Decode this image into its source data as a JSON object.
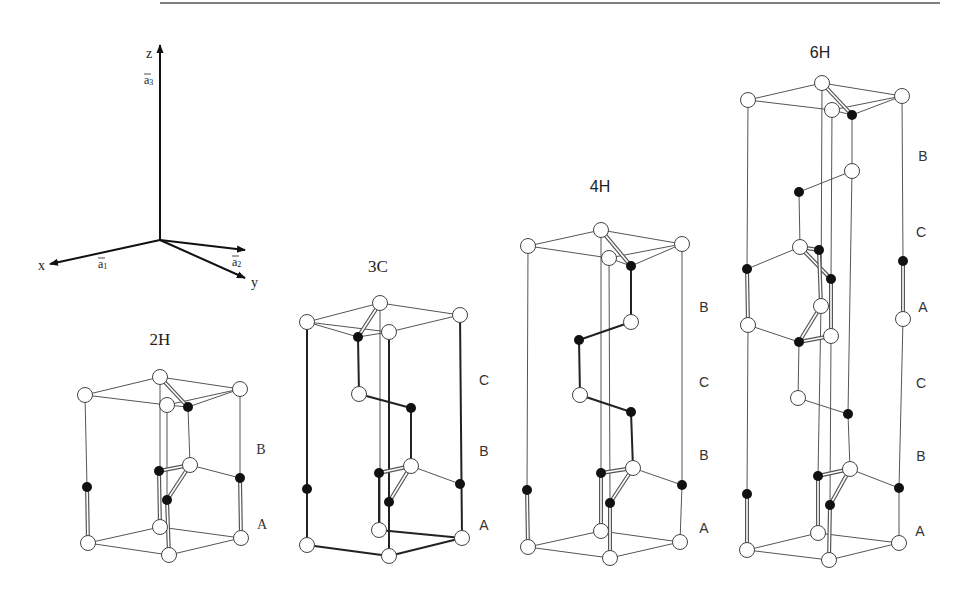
{
  "figure": {
    "top_rule": {
      "x1": 160,
      "x2": 940,
      "y": 3,
      "color": "#555555"
    },
    "axes": {
      "origin": [
        160,
        240
      ],
      "z": {
        "tip": [
          160,
          45
        ],
        "label": "z",
        "label_pos": [
          146,
          58
        ]
      },
      "a3": {
        "label": "a3",
        "label_pos": [
          144,
          84
        ]
      },
      "x": {
        "tip": [
          50,
          264
        ],
        "label": "x",
        "label_pos": [
          38,
          270
        ]
      },
      "a1": {
        "label": "a1",
        "label_pos": [
          98,
          268
        ]
      },
      "a2": {
        "tip": [
          245,
          250
        ],
        "label": "a2",
        "label_pos": [
          232,
          266
        ]
      },
      "y": {
        "tip": [
          245,
          278
        ],
        "label": "y",
        "label_pos": [
          251,
          287
        ]
      }
    },
    "polytypes": [
      {
        "name": "2H",
        "title_pos": [
          160,
          345
        ],
        "title_font": "serif",
        "stacking": [
          {
            "label": "B",
            "pos": [
              261,
              454
            ]
          },
          {
            "label": "A",
            "pos": [
              262,
              529
            ]
          }
        ],
        "open_atoms": [
          [
            85,
            395
          ],
          [
            160,
            377
          ],
          [
            240,
            389
          ],
          [
            167,
            405
          ],
          [
            190,
            465
          ],
          [
            160,
            527
          ],
          [
            88,
            543
          ],
          [
            241,
            538
          ],
          [
            169,
            555
          ]
        ],
        "filled_atoms": [
          [
            188,
            407
          ],
          [
            159,
            471
          ],
          [
            87,
            487
          ],
          [
            240,
            478
          ],
          [
            167,
            500
          ]
        ],
        "lines": [
          [
            85,
            395,
            160,
            377
          ],
          [
            160,
            377,
            240,
            389
          ],
          [
            85,
            395,
            167,
            405
          ],
          [
            167,
            405,
            240,
            389
          ],
          [
            188,
            407,
            240,
            389
          ],
          [
            167,
            405,
            188,
            407
          ],
          [
            85,
            395,
            87,
            487
          ],
          [
            160,
            377,
            160,
            527
          ],
          [
            240,
            389,
            240,
            478
          ],
          [
            167,
            405,
            167,
            500
          ],
          [
            188,
            407,
            190,
            465
          ],
          [
            190,
            465,
            240,
            478
          ],
          [
            88,
            543,
            160,
            527
          ],
          [
            160,
            527,
            241,
            538
          ],
          [
            88,
            543,
            169,
            555
          ],
          [
            169,
            555,
            241,
            538
          ]
        ],
        "double_lines": [
          [
            160,
            377,
            188,
            407
          ],
          [
            159,
            471,
            190,
            465
          ],
          [
            190,
            465,
            167,
            500
          ],
          [
            87,
            487,
            88,
            543
          ],
          [
            240,
            478,
            241,
            538
          ],
          [
            167,
            500,
            169,
            555
          ],
          [
            159,
            471,
            160,
            527
          ]
        ]
      },
      {
        "name": "3C",
        "title_pos": [
          378,
          272
        ],
        "title_font": "serif",
        "stacking": [
          {
            "label": "C",
            "pos": [
              484,
              385
            ]
          },
          {
            "label": "B",
            "pos": [
              484,
              456
            ]
          },
          {
            "label": "A",
            "pos": [
              484,
              530
            ]
          }
        ],
        "open_atoms": [
          [
            307,
            322
          ],
          [
            380,
            303
          ],
          [
            460,
            315
          ],
          [
            389,
            332
          ],
          [
            359,
            394
          ],
          [
            411,
            466
          ],
          [
            379,
            530
          ],
          [
            307,
            545
          ],
          [
            462,
            538
          ],
          [
            389,
            556
          ]
        ],
        "filled_atoms": [
          [
            358,
            337
          ],
          [
            411,
            408
          ],
          [
            379,
            473
          ],
          [
            307,
            489
          ],
          [
            460,
            484
          ],
          [
            389,
            502
          ]
        ],
        "lines": [
          [
            307,
            322,
            380,
            303
          ],
          [
            380,
            303,
            460,
            315
          ],
          [
            307,
            322,
            389,
            332
          ],
          [
            389,
            332,
            460,
            315
          ],
          [
            307,
            322,
            358,
            337
          ],
          [
            358,
            337,
            389,
            332
          ],
          [
            380,
            303,
            380,
            530
          ],
          [
            411,
            466,
            460,
            484
          ]
        ],
        "thick_lines": [
          [
            307,
            322,
            307,
            545
          ],
          [
            460,
            315,
            462,
            538
          ],
          [
            389,
            332,
            389,
            556
          ],
          [
            358,
            337,
            359,
            394
          ],
          [
            359,
            394,
            411,
            408
          ],
          [
            411,
            408,
            411,
            466
          ],
          [
            379,
            473,
            379,
            530
          ],
          [
            307,
            545,
            389,
            556
          ],
          [
            389,
            556,
            462,
            538
          ],
          [
            379,
            530,
            462,
            538
          ]
        ],
        "double_lines": [
          [
            380,
            303,
            358,
            337
          ],
          [
            379,
            473,
            411,
            466
          ],
          [
            411,
            466,
            389,
            502
          ]
        ]
      },
      {
        "name": "4H",
        "title_pos": [
          600,
          192
        ],
        "title_font": "sans",
        "stacking": [
          {
            "label": "B",
            "pos": [
              704,
              312
            ]
          },
          {
            "label": "C",
            "pos": [
              704,
              387
            ]
          },
          {
            "label": "B",
            "pos": [
              704,
              460
            ]
          },
          {
            "label": "A",
            "pos": [
              704,
              533
            ]
          }
        ],
        "open_atoms": [
          [
            528,
            246
          ],
          [
            601,
            230
          ],
          [
            682,
            244
          ],
          [
            609,
            258
          ],
          [
            631,
            322
          ],
          [
            580,
            395
          ],
          [
            633,
            468
          ],
          [
            601,
            531
          ],
          [
            528,
            547
          ],
          [
            680,
            542
          ],
          [
            610,
            558
          ]
        ],
        "filled_atoms": [
          [
            631,
            266
          ],
          [
            579,
            340
          ],
          [
            631,
            412
          ],
          [
            601,
            473
          ],
          [
            527,
            490
          ],
          [
            682,
            485
          ],
          [
            610,
            503
          ]
        ],
        "lines": [
          [
            528,
            246,
            601,
            230
          ],
          [
            601,
            230,
            682,
            244
          ],
          [
            528,
            246,
            609,
            258
          ],
          [
            609,
            258,
            682,
            244
          ],
          [
            631,
            266,
            682,
            244
          ],
          [
            609,
            258,
            631,
            266
          ],
          [
            528,
            246,
            527,
            490
          ],
          [
            682,
            244,
            682,
            485
          ],
          [
            601,
            230,
            601,
            473
          ],
          [
            609,
            258,
            610,
            503
          ],
          [
            633,
            468,
            682,
            485
          ],
          [
            682,
            485,
            680,
            542
          ],
          [
            528,
            547,
            601,
            531
          ],
          [
            601,
            531,
            680,
            542
          ],
          [
            528,
            547,
            610,
            558
          ],
          [
            610,
            558,
            680,
            542
          ]
        ],
        "thick_lines": [
          [
            631,
            266,
            631,
            322
          ],
          [
            631,
            322,
            579,
            340
          ],
          [
            579,
            340,
            580,
            395
          ],
          [
            580,
            395,
            631,
            412
          ],
          [
            631,
            412,
            633,
            468
          ]
        ],
        "double_lines": [
          [
            601,
            230,
            631,
            266
          ],
          [
            601,
            473,
            633,
            468
          ],
          [
            633,
            468,
            610,
            503
          ],
          [
            527,
            490,
            528,
            547
          ],
          [
            601,
            473,
            601,
            531
          ],
          [
            610,
            503,
            610,
            558
          ]
        ]
      },
      {
        "name": "6H",
        "title_pos": [
          820,
          58
        ],
        "title_font": "sans",
        "stacking": [
          {
            "label": "B",
            "pos": [
              923,
              161
            ]
          },
          {
            "label": "C",
            "pos": [
              921,
              237
            ]
          },
          {
            "label": "A",
            "pos": [
              923,
              312
            ]
          },
          {
            "label": "C",
            "pos": [
              921,
              388
            ]
          },
          {
            "label": "B",
            "pos": [
              921,
              461
            ]
          },
          {
            "label": "A",
            "pos": [
              920,
              536
            ]
          }
        ],
        "open_atoms": [
          [
            748,
            100
          ],
          [
            822,
            83
          ],
          [
            902,
            96
          ],
          [
            832,
            110
          ],
          [
            852,
            171
          ],
          [
            800,
            247
          ],
          [
            821,
            306
          ],
          [
            748,
            325
          ],
          [
            903,
            319
          ],
          [
            831,
            336
          ],
          [
            798,
            398
          ],
          [
            850,
            469
          ],
          [
            818,
            533
          ],
          [
            747,
            550
          ],
          [
            899,
            543
          ],
          [
            829,
            560
          ]
        ],
        "filled_atoms": [
          [
            852,
            115
          ],
          [
            799,
            192
          ],
          [
            819,
            250
          ],
          [
            747,
            269
          ],
          [
            831,
            279
          ],
          [
            903,
            261
          ],
          [
            799,
            342
          ],
          [
            848,
            414
          ],
          [
            818,
            476
          ],
          [
            747,
            494
          ],
          [
            899,
            488
          ],
          [
            830,
            505
          ]
        ],
        "lines": [
          [
            748,
            100,
            822,
            83
          ],
          [
            822,
            83,
            902,
            96
          ],
          [
            748,
            100,
            832,
            110
          ],
          [
            832,
            110,
            902,
            96
          ],
          [
            852,
            115,
            902,
            96
          ],
          [
            832,
            110,
            852,
            115
          ],
          [
            748,
            100,
            747,
            269
          ],
          [
            902,
            96,
            903,
            261
          ],
          [
            822,
            83,
            821,
            306
          ],
          [
            832,
            110,
            831,
            279
          ],
          [
            852,
            115,
            852,
            171
          ],
          [
            852,
            171,
            799,
            192
          ],
          [
            799,
            192,
            800,
            247
          ],
          [
            800,
            247,
            747,
            269
          ],
          [
            748,
            325,
            799,
            342
          ],
          [
            799,
            342,
            798,
            398
          ],
          [
            798,
            398,
            848,
            414
          ],
          [
            848,
            414,
            850,
            469
          ],
          [
            852,
            171,
            848,
            414
          ],
          [
            850,
            469,
            899,
            488
          ],
          [
            748,
            325,
            747,
            494
          ],
          [
            903,
            319,
            899,
            488
          ],
          [
            821,
            306,
            818,
            476
          ],
          [
            831,
            336,
            830,
            505
          ],
          [
            747,
            550,
            818,
            533
          ],
          [
            818,
            533,
            899,
            543
          ],
          [
            747,
            550,
            829,
            560
          ],
          [
            829,
            560,
            899,
            543
          ],
          [
            899,
            488,
            899,
            543
          ]
        ],
        "double_lines": [
          [
            822,
            83,
            852,
            115
          ],
          [
            800,
            247,
            819,
            250
          ],
          [
            800,
            247,
            831,
            279
          ],
          [
            819,
            250,
            821,
            306
          ],
          [
            831,
            279,
            831,
            336
          ],
          [
            821,
            306,
            799,
            342
          ],
          [
            799,
            342,
            831,
            336
          ],
          [
            747,
            269,
            748,
            325
          ],
          [
            903,
            261,
            903,
            319
          ],
          [
            818,
            476,
            850,
            469
          ],
          [
            850,
            469,
            830,
            505
          ],
          [
            747,
            494,
            747,
            550
          ],
          [
            818,
            476,
            818,
            533
          ],
          [
            830,
            505,
            829,
            560
          ]
        ]
      }
    ]
  }
}
